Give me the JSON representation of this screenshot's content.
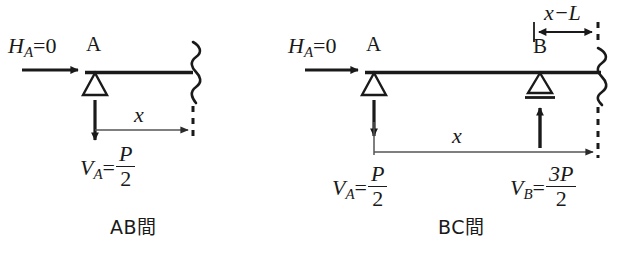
{
  "figure": {
    "type": "engineering-free-body-diagram",
    "background_color": "#ffffff",
    "ink_color": "#1a1a1a",
    "dimension_line_color": "#555555"
  },
  "diagrams": [
    {
      "id": "ab",
      "caption": "AB間",
      "horizontal_reaction": {
        "symbol": "H",
        "subscript": "A",
        "relation": "=",
        "value": "0",
        "text": "H_A=0"
      },
      "supports": [
        {
          "point_label": "A",
          "type": "pin-triangle"
        }
      ],
      "vertical_reaction": {
        "symbol": "V",
        "subscript": "A",
        "relation": "=",
        "numerator": "P",
        "denominator": "2",
        "text": "V_A=P/2",
        "arrow_direction": "down"
      },
      "dimension": {
        "label": "x",
        "arrow": "single-right"
      },
      "cut_section": {
        "style": "zigzag-wavy",
        "continuation": "dashed"
      }
    },
    {
      "id": "bc",
      "caption": "BC間",
      "horizontal_reaction": {
        "symbol": "H",
        "subscript": "A",
        "relation": "=",
        "value": "0",
        "text": "H_A=0"
      },
      "supports": [
        {
          "point_label": "A",
          "type": "pin-triangle"
        },
        {
          "point_label": "B",
          "type": "roller-triangle-with-bar"
        }
      ],
      "vertical_reactions": [
        {
          "symbol": "V",
          "subscript": "A",
          "relation": "=",
          "numerator": "P",
          "denominator": "2",
          "text": "V_A=P/2",
          "arrow_direction": "down"
        },
        {
          "symbol": "V",
          "subscript": "B",
          "relation": "=",
          "numerator": "3P",
          "denominator": "2",
          "text": "V_B=3P/2",
          "arrow_direction": "up"
        }
      ],
      "dimensions": [
        {
          "label": "x",
          "arrow": "single-right"
        },
        {
          "label": "x−L",
          "arrow": "double-headed"
        }
      ],
      "cut_section": {
        "style": "zigzag-wavy",
        "continuation": "dashed"
      }
    }
  ],
  "labels": {
    "point_a": "A",
    "point_b": "B",
    "dim_x": "x",
    "dim_x_minus_l": "x−L",
    "h_symbol": "H",
    "v_symbol": "V",
    "sub_a": "A",
    "sub_b": "B",
    "eq": "=",
    "zero": "0",
    "p": "P",
    "three_p": "3P",
    "two": "2",
    "caption_ab": "AB間",
    "caption_bc": "BC間"
  }
}
